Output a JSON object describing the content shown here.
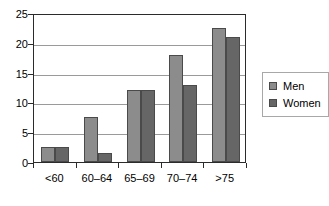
{
  "chart_data": {
    "type": "bar",
    "title": "",
    "subtitle": "",
    "xlabel": "",
    "ylabel": "",
    "categories": [
      "<60",
      "60–64",
      "65–69",
      "70–74",
      ">75"
    ],
    "series": [
      {
        "name": "Men",
        "values": [
          2.5,
          7.5,
          12,
          18,
          22.5
        ],
        "color": "#8c8c8c"
      },
      {
        "name": "Women",
        "values": [
          2.5,
          1.5,
          12,
          13,
          21
        ],
        "color": "#666666"
      }
    ],
    "ylim": [
      0,
      25
    ],
    "ytick_values": [
      0,
      5,
      10,
      15,
      20,
      25
    ],
    "ytick_labels": [
      "0",
      "5",
      "10",
      "15",
      "20",
      "25"
    ],
    "grid": true,
    "grid_axis": "y",
    "legend_position": "right",
    "legend_entries": [
      "Men",
      "Women"
    ],
    "bar_outline_color": "#4a4a4a",
    "axis_color": "#2b2b2b",
    "gridline_color": "#9a9a9a",
    "plot_background": "#ffffff"
  }
}
